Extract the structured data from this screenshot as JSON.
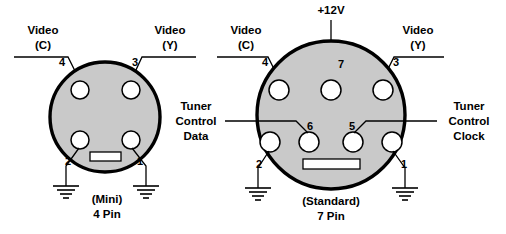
{
  "diagram": {
    "background_color": "#ffffff",
    "body_fill_color": "#c9c9c9",
    "outline_color": "#000000",
    "connectors": [
      {
        "id": "mini-4-pin",
        "caption_line1": "(Mini)",
        "caption_line2": "4 Pin",
        "pins": [
          {
            "number": "4",
            "label": "Video (C)",
            "label_line1": "Video",
            "label_line2": "(C)"
          },
          {
            "number": "3",
            "label": "Video (Y)",
            "label_line1": "Video",
            "label_line2": "(Y)"
          },
          {
            "number": "2",
            "label": "Ground"
          },
          {
            "number": "1",
            "label": "Ground"
          }
        ]
      },
      {
        "id": "standard-7-pin",
        "caption_line1": "(Standard)",
        "caption_line2": "7 Pin",
        "pins": [
          {
            "number": "4",
            "label": "Video (C)",
            "label_line1": "Video",
            "label_line2": "(C)"
          },
          {
            "number": "7",
            "label": "+12V"
          },
          {
            "number": "3",
            "label": "Video (Y)",
            "label_line1": "Video",
            "label_line2": "(Y)"
          },
          {
            "number": "2",
            "label": "Ground"
          },
          {
            "number": "6",
            "label": "Tuner Control Data",
            "label_line1": "Tuner",
            "label_line2": "Control",
            "label_line3": "Data"
          },
          {
            "number": "5",
            "label": "Tuner Control Clock",
            "label_line1": "Tuner",
            "label_line2": "Control",
            "label_line3": "Clock"
          },
          {
            "number": "1",
            "label": "Ground"
          }
        ]
      }
    ],
    "labels": {
      "left_video_c_l1": "Video",
      "left_video_c_l2": "(C)",
      "left_video_y_l1": "Video",
      "left_video_y_l2": "(Y)",
      "right_video_c_l1": "Video",
      "right_video_c_l2": "(C)",
      "right_video_y_l1": "Video",
      "right_video_y_l2": "(Y)",
      "plus_12v": "+12V",
      "tuner_data_l1": "Tuner",
      "tuner_data_l2": "Control",
      "tuner_data_l3": "Data",
      "tuner_clock_l1": "Tuner",
      "tuner_clock_l2": "Control",
      "tuner_clock_l3": "Clock",
      "mini_caption_l1": "(Mini)",
      "mini_caption_l2": "4 Pin",
      "standard_caption_l1": "(Standard)",
      "standard_caption_l2": "7 Pin"
    },
    "pin_numbers": {
      "mini_4": "4",
      "mini_3": "3",
      "mini_2": "2",
      "mini_1": "1",
      "std_4": "4",
      "std_7": "7",
      "std_3": "3",
      "std_2": "2",
      "std_6": "6",
      "std_5": "5",
      "std_1": "1"
    }
  }
}
